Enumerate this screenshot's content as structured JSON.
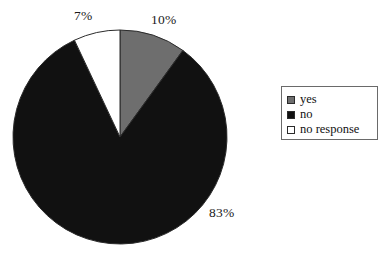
{
  "chart_data": {
    "type": "pie",
    "title": "",
    "subtitle": "",
    "xlabel": "",
    "ylabel": "",
    "grid": false,
    "legend_position": "right",
    "start_angle_deg": 0,
    "direction": "clockwise",
    "categories": [
      "yes",
      "no",
      "no response"
    ],
    "values": [
      10,
      83,
      7
    ],
    "value_unit": "%",
    "data_labels": [
      "10%",
      "83%",
      "7%"
    ],
    "colors": [
      "#6e6e6e",
      "#111111",
      "#ffffff"
    ],
    "slices": [
      {
        "label": "yes",
        "value": 10,
        "data_label": "10%",
        "color": "#6e6e6e",
        "border": "#2b2b2b"
      },
      {
        "label": "no",
        "value": 83,
        "data_label": "83%",
        "color": "#111111",
        "border": "#2b2b2b"
      },
      {
        "label": "no response",
        "value": 7,
        "data_label": "7%",
        "color": "#ffffff",
        "border": "#2b2b2b"
      }
    ]
  },
  "labels": {
    "yes_pct": "10%",
    "no_pct": "83%",
    "no_response_pct": "7%"
  },
  "legend": {
    "items": [
      {
        "label": "yes",
        "swatch_color": "#6e6e6e"
      },
      {
        "label": "no",
        "swatch_color": "#111111"
      },
      {
        "label": "no response",
        "swatch_color": "#ffffff"
      }
    ]
  },
  "colors": {
    "gray": "#6e6e6e",
    "black": "#111111",
    "white": "#ffffff",
    "outline": "#2b2b2b",
    "legend_border": "#6a6a6a",
    "background": "#ffffff"
  }
}
